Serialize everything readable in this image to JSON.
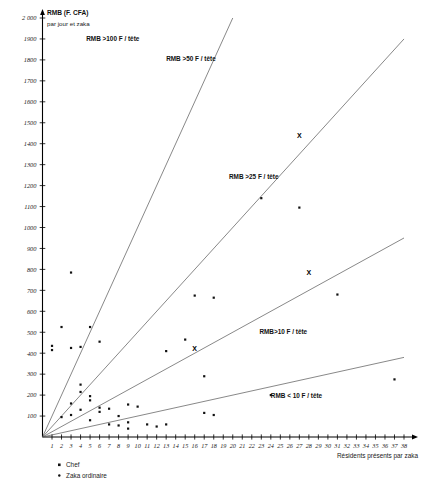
{
  "chart_data": {
    "type": "scatter",
    "title": "RMB (F. CFA)",
    "subtitle": "par jour et zaka",
    "xlabel": "Résidents présents par zaka",
    "ylabel": "RMB (F. CFA) par jour et zaka",
    "xlim": [
      0,
      38
    ],
    "ylim": [
      0,
      2000
    ],
    "grid": false,
    "ytick_labels": [
      "100",
      "200",
      "300",
      "400",
      "500",
      "600",
      "700",
      "800",
      "900",
      "1000",
      "1100",
      "1200",
      "1300",
      "1400",
      "1500",
      "1600",
      "1700",
      "1800",
      "1900",
      "2 000"
    ],
    "ytick_values": [
      100,
      200,
      300,
      400,
      500,
      600,
      700,
      800,
      900,
      1000,
      1100,
      1200,
      1300,
      1400,
      1500,
      1600,
      1700,
      1800,
      1900,
      2000
    ],
    "xtick_labels": [
      "1",
      "2",
      "3",
      "4",
      "5",
      "6",
      "7",
      "8",
      "9",
      "10",
      "11",
      "12",
      "13",
      "14",
      "15",
      "16",
      "17",
      "18",
      "19",
      "20",
      "21",
      "22",
      "23",
      "24",
      "25",
      "26",
      "27",
      "28",
      "29",
      "30",
      "31",
      "32",
      "33",
      "34",
      "35",
      "36",
      "37",
      "38"
    ],
    "xtick_values": [
      1,
      2,
      3,
      4,
      5,
      6,
      7,
      8,
      9,
      10,
      11,
      12,
      13,
      14,
      15,
      16,
      17,
      18,
      19,
      20,
      21,
      22,
      23,
      24,
      25,
      26,
      27,
      28,
      29,
      30,
      31,
      32,
      33,
      34,
      35,
      36,
      37,
      38
    ],
    "zone_labels": [
      {
        "text": "RMB >100 F / tête",
        "x": 4.6,
        "y": 1890
      },
      {
        "text": "RMB >50 F / tête",
        "x": 13.0,
        "y": 1795
      },
      {
        "text": "RMB >25 F / tête",
        "x": 19.6,
        "y": 1230
      },
      {
        "text": "RMB>10 F / tête",
        "x": 22.8,
        "y": 490
      },
      {
        "text": "RMB < 10 F / tête",
        "x": 24.0,
        "y": 185
      }
    ],
    "reference_rays": [
      {
        "name": "100 F per head",
        "slope": 100,
        "label": "RMB >100 F / tête"
      },
      {
        "name": "50 F per head",
        "slope": 50,
        "label": "RMB >50 F / tête"
      },
      {
        "name": "25 F per head",
        "slope": 25,
        "label": "RMB >25 F / tête"
      },
      {
        "name": "10 F per head",
        "slope": 10,
        "label": "RMB >10 F / tête"
      }
    ],
    "series": [
      {
        "name": "Chef",
        "marker": "square",
        "points": [
          {
            "x": 16,
            "y": 425
          },
          {
            "x": 27,
            "y": 1440
          },
          {
            "x": 28,
            "y": 785
          }
        ]
      },
      {
        "name": "Zaka ordinaire",
        "marker": "dot",
        "points": [
          {
            "x": 2,
            "y": 525
          },
          {
            "x": 1,
            "y": 435
          },
          {
            "x": 1,
            "y": 415
          },
          {
            "x": 3,
            "y": 785
          },
          {
            "x": 3,
            "y": 425
          },
          {
            "x": 4,
            "y": 430
          },
          {
            "x": 5,
            "y": 525
          },
          {
            "x": 6,
            "y": 455
          },
          {
            "x": 4,
            "y": 250
          },
          {
            "x": 4,
            "y": 215
          },
          {
            "x": 5,
            "y": 195
          },
          {
            "x": 5,
            "y": 175
          },
          {
            "x": 3,
            "y": 160
          },
          {
            "x": 4,
            "y": 130
          },
          {
            "x": 3,
            "y": 105
          },
          {
            "x": 2,
            "y": 95
          },
          {
            "x": 5,
            "y": 80
          },
          {
            "x": 6,
            "y": 140
          },
          {
            "x": 6,
            "y": 120
          },
          {
            "x": 7,
            "y": 135
          },
          {
            "x": 7,
            "y": 60
          },
          {
            "x": 8,
            "y": 100
          },
          {
            "x": 8,
            "y": 55
          },
          {
            "x": 9,
            "y": 155
          },
          {
            "x": 9,
            "y": 70
          },
          {
            "x": 9,
            "y": 40
          },
          {
            "x": 10,
            "y": 145
          },
          {
            "x": 11,
            "y": 60
          },
          {
            "x": 12,
            "y": 50
          },
          {
            "x": 13,
            "y": 60
          },
          {
            "x": 13,
            "y": 410
          },
          {
            "x": 15,
            "y": 465
          },
          {
            "x": 16,
            "y": 675
          },
          {
            "x": 18,
            "y": 665
          },
          {
            "x": 17,
            "y": 115
          },
          {
            "x": 18,
            "y": 105
          },
          {
            "x": 23,
            "y": 1140
          },
          {
            "x": 27,
            "y": 1095
          },
          {
            "x": 17,
            "y": 290
          },
          {
            "x": 31,
            "y": 680
          },
          {
            "x": 24,
            "y": 200
          },
          {
            "x": 37,
            "y": 275
          }
        ]
      }
    ],
    "legend": [
      {
        "label": "Chef",
        "marker": "square"
      },
      {
        "label": "Zaka ordinaire",
        "marker": "dot"
      }
    ],
    "legend_position": "bottom-left"
  },
  "colors": {
    "axis": "#000000",
    "ray": "#555555",
    "point": "#111111",
    "background": "#ffffff"
  }
}
